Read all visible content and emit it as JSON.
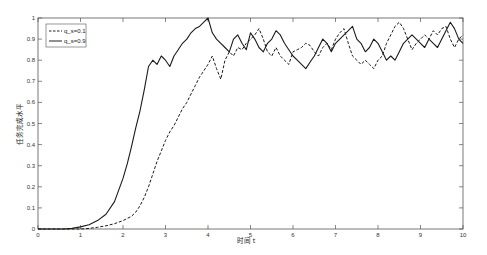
{
  "chart_data": {
    "type": "line",
    "title": "",
    "xlabel": "时间 t",
    "ylabel": "任务完成水平",
    "xlim": [
      0,
      10
    ],
    "ylim": [
      0,
      1
    ],
    "grid": false,
    "legend_position": "upper-left",
    "xticks": [
      "0",
      "1",
      "2",
      "3",
      "4",
      "5",
      "6",
      "7",
      "8",
      "9",
      "10"
    ],
    "yticks": [
      "0",
      "0.1",
      "0.2",
      "0.3",
      "0.4",
      "0.5",
      "0.6",
      "0.7",
      "0.8",
      "0.9",
      "1"
    ],
    "x": [
      0,
      0.2,
      0.4,
      0.6,
      0.8,
      1.0,
      1.2,
      1.4,
      1.6,
      1.8,
      2.0,
      2.1,
      2.2,
      2.3,
      2.4,
      2.5,
      2.6,
      2.7,
      2.8,
      2.9,
      3.0,
      3.1,
      3.2,
      3.3,
      3.4,
      3.5,
      3.6,
      3.7,
      3.8,
      3.9,
      4.0,
      4.1,
      4.2,
      4.3,
      4.4,
      4.5,
      4.6,
      4.7,
      4.8,
      4.9,
      5.0,
      5.1,
      5.2,
      5.3,
      5.4,
      5.5,
      5.6,
      5.7,
      5.8,
      5.9,
      6.0,
      6.1,
      6.2,
      6.3,
      6.4,
      6.5,
      6.6,
      6.7,
      6.8,
      6.9,
      7.0,
      7.1,
      7.2,
      7.3,
      7.4,
      7.5,
      7.6,
      7.7,
      7.8,
      7.9,
      8.0,
      8.1,
      8.2,
      8.3,
      8.4,
      8.5,
      8.6,
      8.7,
      8.8,
      8.9,
      9.0,
      9.1,
      9.2,
      9.3,
      9.4,
      9.5,
      9.6,
      9.7,
      9.8,
      9.9,
      10.0
    ],
    "series": [
      {
        "name": "q_s=0.1",
        "style": "dashed",
        "values": [
          0,
          0,
          0,
          0,
          0,
          0,
          0.003,
          0.008,
          0.015,
          0.025,
          0.04,
          0.05,
          0.06,
          0.08,
          0.11,
          0.15,
          0.2,
          0.26,
          0.32,
          0.37,
          0.42,
          0.46,
          0.49,
          0.53,
          0.57,
          0.6,
          0.64,
          0.68,
          0.72,
          0.75,
          0.78,
          0.82,
          0.76,
          0.71,
          0.8,
          0.84,
          0.82,
          0.86,
          0.85,
          0.88,
          0.9,
          0.92,
          0.95,
          0.9,
          0.84,
          0.82,
          0.86,
          0.82,
          0.8,
          0.78,
          0.84,
          0.85,
          0.86,
          0.88,
          0.87,
          0.84,
          0.82,
          0.86,
          0.88,
          0.85,
          0.9,
          0.93,
          0.95,
          0.88,
          0.82,
          0.8,
          0.78,
          0.8,
          0.78,
          0.76,
          0.8,
          0.82,
          0.88,
          0.92,
          0.96,
          0.98,
          0.95,
          0.9,
          0.85,
          0.88,
          0.9,
          0.92,
          0.9,
          0.94,
          0.92,
          0.95,
          0.96,
          0.9,
          0.86,
          0.9,
          0.92
        ]
      },
      {
        "name": "q_s=0.9",
        "style": "solid",
        "values": [
          0,
          0,
          0,
          0,
          0.003,
          0.01,
          0.02,
          0.04,
          0.07,
          0.13,
          0.24,
          0.31,
          0.39,
          0.48,
          0.56,
          0.66,
          0.77,
          0.8,
          0.78,
          0.82,
          0.8,
          0.77,
          0.82,
          0.85,
          0.88,
          0.9,
          0.93,
          0.95,
          0.96,
          0.98,
          1.0,
          0.93,
          0.9,
          0.88,
          0.86,
          0.84,
          0.9,
          0.92,
          0.88,
          0.85,
          0.93,
          0.9,
          0.86,
          0.84,
          0.88,
          0.9,
          0.94,
          0.92,
          0.88,
          0.85,
          0.82,
          0.8,
          0.78,
          0.76,
          0.79,
          0.82,
          0.86,
          0.9,
          0.88,
          0.84,
          0.88,
          0.9,
          0.92,
          0.94,
          0.96,
          0.9,
          0.88,
          0.84,
          0.86,
          0.9,
          0.88,
          0.84,
          0.8,
          0.82,
          0.8,
          0.84,
          0.88,
          0.9,
          0.92,
          0.9,
          0.88,
          0.86,
          0.9,
          0.88,
          0.86,
          0.9,
          0.94,
          0.98,
          0.95,
          0.9,
          0.88
        ]
      }
    ]
  }
}
